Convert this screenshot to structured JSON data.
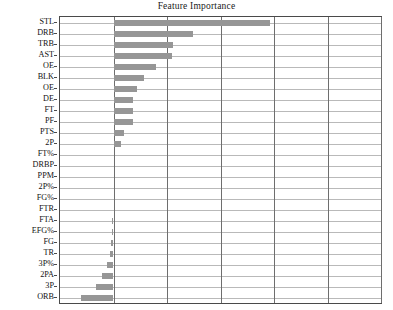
{
  "chart": {
    "title": "Feature Importance",
    "xlabel": "",
    "ylabel": ""
  },
  "chart_data": {
    "type": "bar",
    "orientation": "horizontal",
    "title": "Feature Importance",
    "xlabel": "",
    "ylabel": "",
    "grid": true,
    "legend": false,
    "xlim": [
      -0.0125,
      0.0625
    ],
    "xticks": [
      -0.0125,
      0.0,
      0.0125,
      0.025,
      0.0375,
      0.05,
      0.0625
    ],
    "categories": [
      "STL",
      "DRB",
      "TRB",
      "AST",
      "OE",
      "BLK",
      "OE",
      "DE",
      "FT",
      "PF",
      "PTS",
      "2P",
      "FT%",
      "DRBP",
      "PPM",
      "2P%",
      "FG%",
      "FTR",
      "FTA",
      "EFG%",
      "FG",
      "TR",
      "3P%",
      "2PA",
      "3P",
      "ORB"
    ],
    "values": [
      0.0365,
      0.0186,
      0.014,
      0.0136,
      0.01,
      0.0072,
      0.0055,
      0.0045,
      0.0046,
      0.0045,
      0.0024,
      0.0018,
      0.0,
      0.0,
      0.0,
      0.0,
      0.0,
      0.0,
      -0.0003,
      -0.0004,
      -0.0005,
      -0.0008,
      -0.0016,
      -0.0026,
      -0.0042,
      -0.0075
    ],
    "bar_color": "#969696",
    "grid_color": "#b9b9b9",
    "axis_color": "#4a4a4a"
  }
}
